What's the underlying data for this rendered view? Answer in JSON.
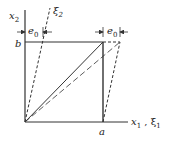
{
  "diagram": {
    "labels": {
      "x2": "x",
      "x2_sub": "2",
      "xi2": "ξ",
      "xi2_sub": "2",
      "b": "b",
      "a": "a",
      "x1": "x",
      "x1_sub": "1",
      "comma": " , ",
      "xi1": "ξ",
      "xi1_sub": "1",
      "e0_left": "e",
      "e0_left_sub": "0",
      "e0_right": "e",
      "e0_right_sub": "0"
    },
    "colors": {
      "line": "#333333",
      "background": "#ffffff"
    }
  }
}
